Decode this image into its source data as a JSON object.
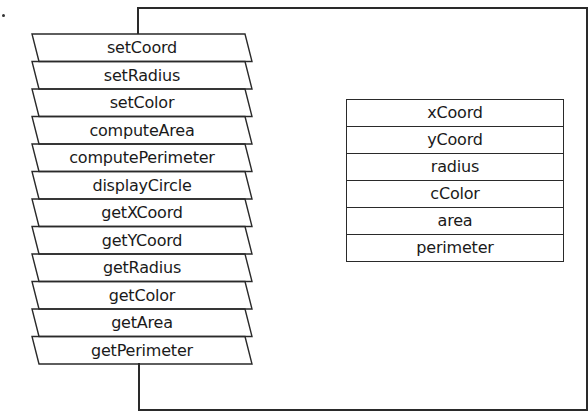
{
  "diagram": {
    "methods": [
      {
        "label": "setCoord"
      },
      {
        "label": "setRadius"
      },
      {
        "label": "setColor"
      },
      {
        "label": "computeArea"
      },
      {
        "label": "computePerimeter"
      },
      {
        "label": "displayCircle"
      },
      {
        "label": "getXCoord"
      },
      {
        "label": "getYCoord"
      },
      {
        "label": "getRadius"
      },
      {
        "label": "getColor"
      },
      {
        "label": "getArea"
      },
      {
        "label": "getPerimeter"
      }
    ],
    "fields": [
      {
        "label": "xCoord"
      },
      {
        "label": "yCoord"
      },
      {
        "label": "radius"
      },
      {
        "label": "cColor"
      },
      {
        "label": "area"
      },
      {
        "label": "perimeter"
      }
    ],
    "colors": {
      "stroke": "#2a2a2a",
      "background": "#ffffff",
      "text": "#1a1a1a"
    }
  }
}
